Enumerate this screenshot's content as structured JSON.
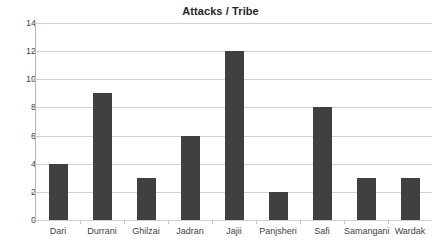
{
  "chart_data": {
    "type": "bar",
    "title": "Attacks / Tribe",
    "xlabel": "",
    "ylabel": "",
    "categories": [
      "Dari",
      "Durrani",
      "Ghilzai",
      "Jadran",
      "Jajii",
      "Panjsheri",
      "Safi",
      "Samangani",
      "Wardak"
    ],
    "values": [
      4,
      9,
      3,
      6,
      12,
      2,
      8,
      3,
      3
    ],
    "ylim": [
      0,
      14
    ],
    "ytick_labels": [
      "0",
      "2",
      "4",
      "6",
      "8",
      "10",
      "12",
      "14"
    ],
    "ytick_values": [
      0,
      2,
      4,
      6,
      8,
      10,
      12,
      14
    ],
    "grid": true,
    "legend": false,
    "bar_color": "#404040",
    "gridline_color": "#d0d0d0",
    "axis_color": "#b8b8b8",
    "text_color": "#3f3f3f",
    "title_color": "#262626"
  }
}
